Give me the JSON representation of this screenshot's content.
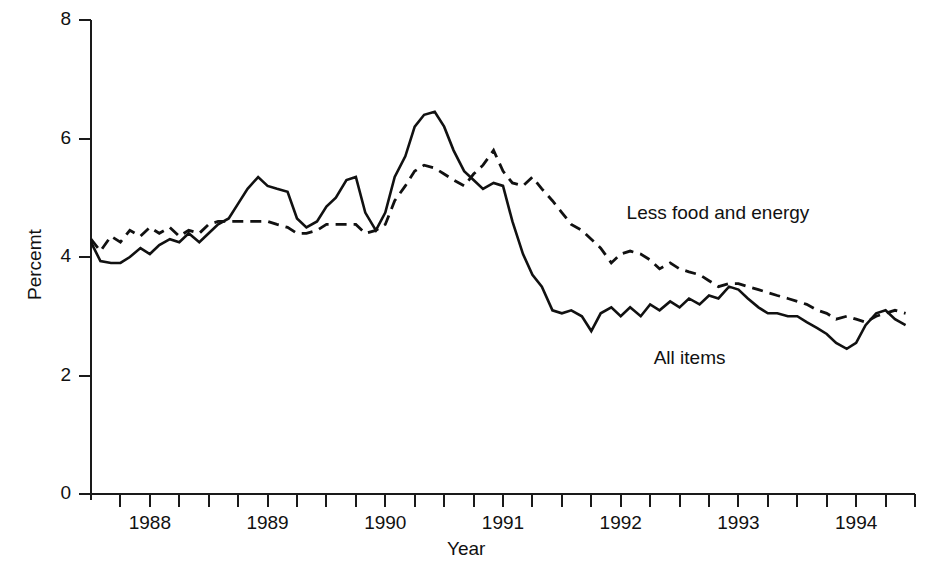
{
  "chart_data": {
    "type": "line",
    "title": "",
    "xlabel": "Year",
    "ylabel": "Percemt",
    "ylim": [
      0,
      8
    ],
    "xlim": [
      1987.5,
      1994.5
    ],
    "yticks": [
      0,
      2,
      4,
      6,
      8
    ],
    "ytick_labels": [
      "0",
      "2",
      "4",
      "6",
      "8"
    ],
    "xticks": [
      1988,
      1989,
      1990,
      1991,
      1992,
      1993,
      1994
    ],
    "xtick_labels": [
      "1988",
      "1989",
      "1990",
      "1991",
      "1992",
      "1993",
      "1994"
    ],
    "minor_tick_interval": 0.25,
    "grid": false,
    "legend_position": "inline-annotations",
    "annotations": [
      {
        "text": "Less food and energy",
        "x": 1992.05,
        "y": 4.72
      },
      {
        "text": "All items",
        "x": 1992.28,
        "y": 2.28
      }
    ],
    "series": [
      {
        "name": "All items",
        "style": "solid",
        "x": [
          1987.5,
          1987.58,
          1987.67,
          1987.75,
          1987.83,
          1987.92,
          1988.0,
          1988.08,
          1988.17,
          1988.25,
          1988.33,
          1988.42,
          1988.5,
          1988.58,
          1988.67,
          1988.75,
          1988.83,
          1988.92,
          1989.0,
          1989.08,
          1989.17,
          1989.25,
          1989.33,
          1989.42,
          1989.5,
          1989.58,
          1989.67,
          1989.75,
          1989.83,
          1989.92,
          1990.0,
          1990.08,
          1990.17,
          1990.25,
          1990.33,
          1990.42,
          1990.5,
          1990.58,
          1990.67,
          1990.75,
          1990.83,
          1990.92,
          1991.0,
          1991.08,
          1991.17,
          1991.25,
          1991.33,
          1991.42,
          1991.5,
          1991.58,
          1991.67,
          1991.75,
          1991.83,
          1991.92,
          1992.0,
          1992.08,
          1992.17,
          1992.25,
          1992.33,
          1992.42,
          1992.5,
          1992.58,
          1992.67,
          1992.75,
          1992.83,
          1992.92,
          1993.0,
          1993.08,
          1993.17,
          1993.25,
          1993.33,
          1993.42,
          1993.5,
          1993.58,
          1993.67,
          1993.75,
          1993.83,
          1993.92,
          1994.0,
          1994.08,
          1994.17,
          1994.25,
          1994.33,
          1994.42
        ],
        "y": [
          4.25,
          3.93,
          3.9,
          3.9,
          4.0,
          4.15,
          4.05,
          4.2,
          4.3,
          4.25,
          4.4,
          4.25,
          4.4,
          4.55,
          4.65,
          4.9,
          5.15,
          5.35,
          5.2,
          5.15,
          5.1,
          4.65,
          4.5,
          4.6,
          4.85,
          5.0,
          5.3,
          5.35,
          4.75,
          4.45,
          4.75,
          5.35,
          5.7,
          6.2,
          6.4,
          6.45,
          6.2,
          5.8,
          5.45,
          5.3,
          5.15,
          5.25,
          5.2,
          4.6,
          4.05,
          3.7,
          3.5,
          3.1,
          3.05,
          3.1,
          3.0,
          2.75,
          3.05,
          3.15,
          3.0,
          3.15,
          3.0,
          3.2,
          3.1,
          3.25,
          3.15,
          3.3,
          3.2,
          3.35,
          3.3,
          3.5,
          3.45,
          3.3,
          3.15,
          3.05,
          3.05,
          3.0,
          3.0,
          2.9,
          2.8,
          2.7,
          2.55,
          2.45,
          2.55,
          2.85,
          3.05,
          3.1,
          2.95,
          2.85
        ]
      },
      {
        "name": "Less food and energy",
        "style": "dashed",
        "x": [
          1987.5,
          1987.58,
          1987.67,
          1987.75,
          1987.83,
          1987.92,
          1988.0,
          1988.08,
          1988.17,
          1988.25,
          1988.33,
          1988.42,
          1988.5,
          1988.58,
          1988.67,
          1988.75,
          1988.83,
          1988.92,
          1989.0,
          1989.08,
          1989.17,
          1989.25,
          1989.33,
          1989.42,
          1989.5,
          1989.58,
          1989.67,
          1989.75,
          1989.83,
          1989.92,
          1990.0,
          1990.08,
          1990.17,
          1990.25,
          1990.33,
          1990.42,
          1990.5,
          1990.58,
          1990.67,
          1990.75,
          1990.83,
          1990.92,
          1991.0,
          1991.08,
          1991.17,
          1991.25,
          1991.33,
          1991.42,
          1991.5,
          1991.58,
          1991.67,
          1991.75,
          1991.83,
          1991.92,
          1992.0,
          1992.08,
          1992.17,
          1992.25,
          1992.33,
          1992.42,
          1992.5,
          1992.58,
          1992.67,
          1992.75,
          1992.83,
          1992.92,
          1993.0,
          1993.08,
          1993.17,
          1993.25,
          1993.33,
          1993.42,
          1993.5,
          1993.58,
          1993.67,
          1993.75,
          1993.83,
          1993.92,
          1994.0,
          1994.08,
          1994.17,
          1994.25,
          1994.33,
          1994.42
        ],
        "y": [
          4.3,
          4.1,
          4.35,
          4.25,
          4.45,
          4.35,
          4.5,
          4.4,
          4.5,
          4.35,
          4.45,
          4.4,
          4.55,
          4.6,
          4.6,
          4.6,
          4.6,
          4.6,
          4.6,
          4.55,
          4.5,
          4.4,
          4.4,
          4.45,
          4.55,
          4.55,
          4.55,
          4.55,
          4.4,
          4.45,
          4.55,
          4.95,
          5.2,
          5.45,
          5.55,
          5.5,
          5.4,
          5.3,
          5.2,
          5.4,
          5.55,
          5.8,
          5.45,
          5.25,
          5.2,
          5.35,
          5.15,
          4.95,
          4.75,
          4.55,
          4.45,
          4.3,
          4.15,
          3.9,
          4.05,
          4.1,
          4.05,
          3.95,
          3.8,
          3.9,
          3.8,
          3.75,
          3.7,
          3.6,
          3.5,
          3.55,
          3.55,
          3.5,
          3.45,
          3.4,
          3.35,
          3.3,
          3.25,
          3.2,
          3.1,
          3.05,
          2.95,
          3.0,
          2.95,
          2.9,
          3.0,
          3.05,
          3.1,
          3.05
        ]
      }
    ]
  },
  "plot": {
    "left_px": 91,
    "right_px": 915,
    "top_px": 20,
    "bottom_px": 494
  }
}
